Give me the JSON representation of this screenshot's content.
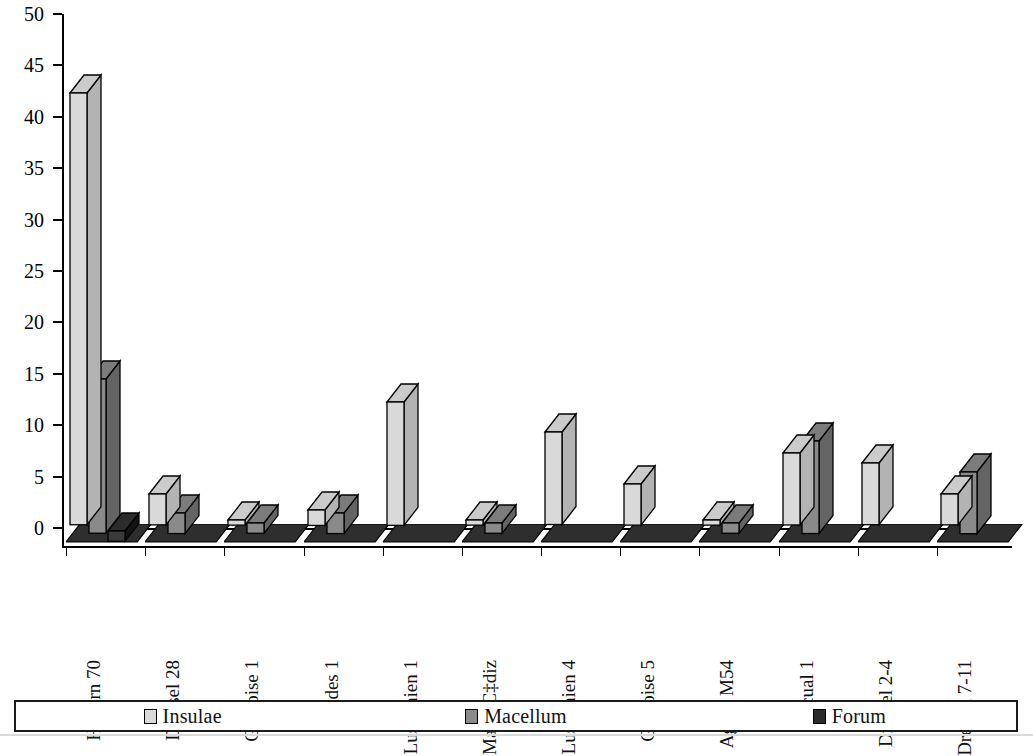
{
  "chart_data": {
    "type": "bar",
    "title": "",
    "subtitle": "",
    "xlabel": "",
    "ylabel": "",
    "ylim": [
      0,
      50
    ],
    "ytick_step": 5,
    "yticks": [
      0,
      5,
      10,
      15,
      20,
      25,
      30,
      35,
      40,
      45,
      50
    ],
    "grid": false,
    "style": "3d-grouped-bar-grayscale",
    "legend_position": "bottom",
    "categories": [
      "Haltern 70",
      "Dressel 28",
      "Gauloise 1",
      "Rhodes 1",
      "Lusitanien 1",
      "Man‡/C‡diz",
      "Lusitanien 4",
      "Gauloise 5",
      "Agora M54",
      "Pascual 1",
      "Dressel 2-4",
      "Dressel 7-11"
    ],
    "series": [
      {
        "name": "Insulae",
        "color": "#d9d9d9",
        "values": [
          42,
          3,
          0.5,
          1.5,
          12,
          0.5,
          9,
          4,
          0.5,
          7,
          6,
          3
        ]
      },
      {
        "name": "Macellum",
        "color": "#8a8a8a",
        "values": [
          15,
          2,
          1,
          2,
          0,
          1,
          0,
          0,
          1,
          9,
          0,
          6
        ]
      },
      {
        "name": "Forum",
        "color": "#3a3a3a",
        "values": [
          1,
          0,
          0,
          0,
          0,
          0,
          0,
          0,
          0,
          0,
          0,
          0
        ]
      }
    ]
  },
  "axis": {
    "y_tick_labels": [
      "50",
      "45",
      "40",
      "35",
      "30",
      "25",
      "20",
      "15",
      "10",
      "5",
      "0"
    ]
  },
  "legend": {
    "items": [
      {
        "label": "Insulae",
        "color": "#d9d9d9"
      },
      {
        "label": "Macellum",
        "color": "#8a8a8a"
      },
      {
        "label": "Forum",
        "color": "#2b2b2b"
      }
    ]
  }
}
